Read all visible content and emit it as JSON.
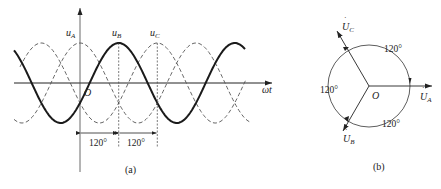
{
  "figure_a": {
    "caption": "(a)",
    "axis_y_label": "",
    "axis_x_label": "ωt",
    "origin_label": "O",
    "curves": [
      {
        "name": "u_A",
        "label_main": "u",
        "label_sub": "A",
        "style": "dashed",
        "peak_deg": 0
      },
      {
        "name": "u_B",
        "label_main": "u",
        "label_sub": "B",
        "style": "solid-bold",
        "peak_deg": 120
      },
      {
        "name": "u_C",
        "label_main": "u",
        "label_sub": "C",
        "style": "dashed",
        "peak_deg": 240
      }
    ],
    "dimension_labels": [
      "120°",
      "120°"
    ]
  },
  "figure_b": {
    "caption": "(b)",
    "origin_label": "O",
    "phasors": [
      {
        "name": "U_A",
        "label_main": "U",
        "label_sub": "A",
        "angle_deg": 0
      },
      {
        "name": "U_B",
        "label_main": "U",
        "label_sub": "B",
        "angle_deg": -120
      },
      {
        "name": "U_C",
        "label_main": "U",
        "label_sub": "C",
        "angle_deg": 120
      }
    ],
    "angle_labels": [
      "120°",
      "120°",
      "120°"
    ]
  },
  "colors": {
    "ink": "#222222",
    "dashed": "#555555",
    "background": "#ffffff"
  }
}
